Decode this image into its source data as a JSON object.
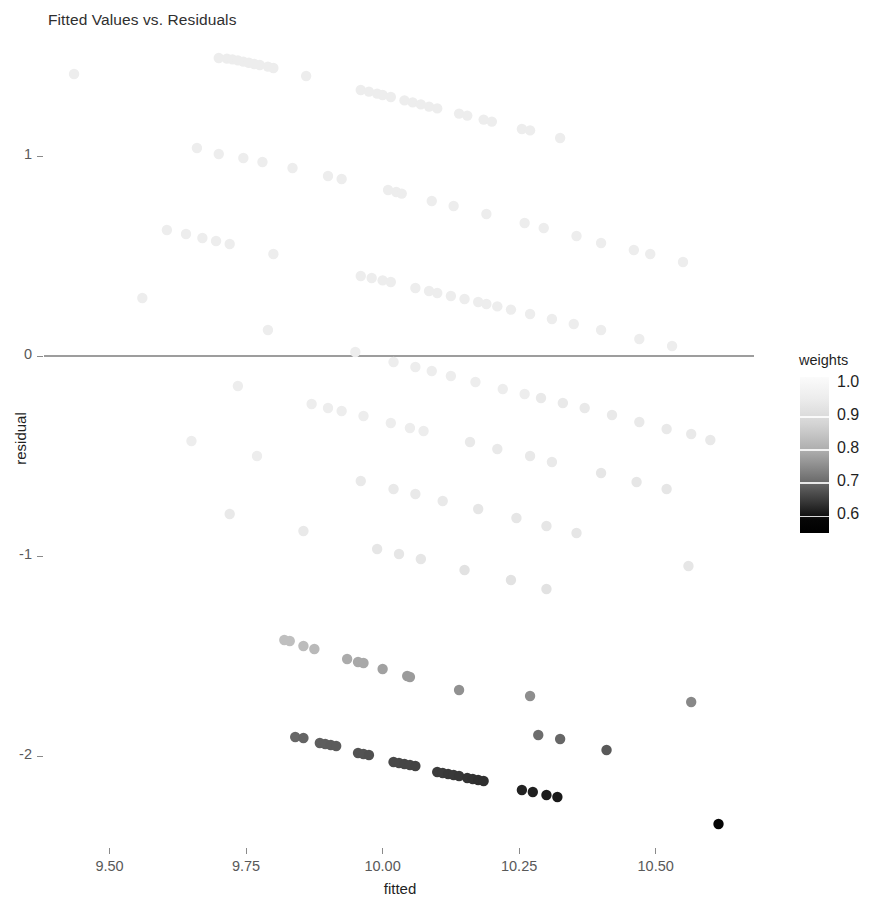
{
  "title": "Fitted Values vs. Residuals",
  "axes": {
    "x_title": "fitted",
    "y_title": "residual",
    "x_ticks": [
      "9.50",
      "9.75",
      "10.00",
      "10.25",
      "10.50"
    ],
    "y_ticks": [
      "1",
      "0",
      "-1",
      "-2"
    ]
  },
  "legend": {
    "title": "weights",
    "labels": [
      "1.0",
      "0.9",
      "0.8",
      "0.7",
      "0.6"
    ]
  },
  "chart_data": {
    "type": "scatter",
    "title": "Fitted Values vs. Residuals",
    "xlabel": "fitted",
    "ylabel": "residual",
    "xlim": [
      9.38,
      10.68
    ],
    "ylim": [
      -2.45,
      1.55
    ],
    "xticks": [
      9.5,
      9.75,
      10.0,
      10.25,
      10.5
    ],
    "yticks": [
      1,
      0,
      -1,
      -2
    ],
    "grid": false,
    "legend": {
      "title": "weights",
      "type": "continuous-colorbar",
      "position": "right",
      "ticks": [
        1.0,
        0.9,
        0.8,
        0.7,
        0.6
      ],
      "range": [
        0.55,
        1.02
      ],
      "low_color": "#000000",
      "high_color": "#ffffff"
    },
    "annotations": [
      {
        "type": "hline",
        "y": 0,
        "color": "#3d3d3d"
      }
    ],
    "color_key": "weights",
    "points": [
      {
        "x": 9.435,
        "y": 1.41,
        "w": 0.995
      },
      {
        "x": 9.7,
        "y": 1.49,
        "w": 0.995
      },
      {
        "x": 9.715,
        "y": 1.487,
        "w": 0.995
      },
      {
        "x": 9.725,
        "y": 1.483,
        "w": 0.995
      },
      {
        "x": 9.735,
        "y": 1.478,
        "w": 0.995
      },
      {
        "x": 9.745,
        "y": 1.472,
        "w": 0.995
      },
      {
        "x": 9.755,
        "y": 1.466,
        "w": 0.995
      },
      {
        "x": 9.765,
        "y": 1.46,
        "w": 0.995
      },
      {
        "x": 9.775,
        "y": 1.455,
        "w": 0.995
      },
      {
        "x": 9.79,
        "y": 1.447,
        "w": 0.995
      },
      {
        "x": 9.8,
        "y": 1.44,
        "w": 0.995
      },
      {
        "x": 9.86,
        "y": 1.4,
        "w": 0.995
      },
      {
        "x": 9.96,
        "y": 1.33,
        "w": 0.995
      },
      {
        "x": 9.975,
        "y": 1.322,
        "w": 0.995
      },
      {
        "x": 9.99,
        "y": 1.312,
        "w": 0.995
      },
      {
        "x": 10.0,
        "y": 1.305,
        "w": 0.995
      },
      {
        "x": 10.015,
        "y": 1.295,
        "w": 0.995
      },
      {
        "x": 10.04,
        "y": 1.278,
        "w": 0.995
      },
      {
        "x": 10.055,
        "y": 1.268,
        "w": 0.995
      },
      {
        "x": 10.07,
        "y": 1.258,
        "w": 0.995
      },
      {
        "x": 10.085,
        "y": 1.247,
        "w": 0.995
      },
      {
        "x": 10.1,
        "y": 1.238,
        "w": 0.995
      },
      {
        "x": 10.14,
        "y": 1.212,
        "w": 0.995
      },
      {
        "x": 10.155,
        "y": 1.202,
        "w": 0.995
      },
      {
        "x": 10.185,
        "y": 1.182,
        "w": 0.995
      },
      {
        "x": 10.2,
        "y": 1.172,
        "w": 0.995
      },
      {
        "x": 10.255,
        "y": 1.135,
        "w": 0.995
      },
      {
        "x": 10.27,
        "y": 1.128,
        "w": 0.995
      },
      {
        "x": 10.325,
        "y": 1.09,
        "w": 0.995
      },
      {
        "x": 9.66,
        "y": 1.04,
        "w": 0.995
      },
      {
        "x": 9.7,
        "y": 1.01,
        "w": 0.995
      },
      {
        "x": 9.745,
        "y": 0.99,
        "w": 0.995
      },
      {
        "x": 9.78,
        "y": 0.97,
        "w": 0.995
      },
      {
        "x": 9.835,
        "y": 0.94,
        "w": 0.995
      },
      {
        "x": 9.9,
        "y": 0.9,
        "w": 0.995
      },
      {
        "x": 9.925,
        "y": 0.885,
        "w": 0.995
      },
      {
        "x": 10.01,
        "y": 0.83,
        "w": 0.995
      },
      {
        "x": 10.025,
        "y": 0.82,
        "w": 0.995
      },
      {
        "x": 10.035,
        "y": 0.812,
        "w": 0.995
      },
      {
        "x": 10.09,
        "y": 0.775,
        "w": 0.995
      },
      {
        "x": 10.13,
        "y": 0.75,
        "w": 0.995
      },
      {
        "x": 10.19,
        "y": 0.71,
        "w": 0.995
      },
      {
        "x": 10.26,
        "y": 0.665,
        "w": 0.995
      },
      {
        "x": 10.295,
        "y": 0.64,
        "w": 0.995
      },
      {
        "x": 10.355,
        "y": 0.6,
        "w": 0.995
      },
      {
        "x": 10.4,
        "y": 0.565,
        "w": 0.995
      },
      {
        "x": 10.46,
        "y": 0.53,
        "w": 0.995
      },
      {
        "x": 10.49,
        "y": 0.51,
        "w": 0.995
      },
      {
        "x": 10.55,
        "y": 0.47,
        "w": 0.995
      },
      {
        "x": 9.605,
        "y": 0.63,
        "w": 0.995
      },
      {
        "x": 9.64,
        "y": 0.61,
        "w": 0.995
      },
      {
        "x": 9.67,
        "y": 0.59,
        "w": 0.995
      },
      {
        "x": 9.695,
        "y": 0.575,
        "w": 0.995
      },
      {
        "x": 9.72,
        "y": 0.56,
        "w": 0.995
      },
      {
        "x": 9.8,
        "y": 0.51,
        "w": 0.995
      },
      {
        "x": 9.96,
        "y": 0.4,
        "w": 0.995
      },
      {
        "x": 9.98,
        "y": 0.39,
        "w": 0.995
      },
      {
        "x": 10.0,
        "y": 0.378,
        "w": 0.995
      },
      {
        "x": 10.015,
        "y": 0.37,
        "w": 0.995
      },
      {
        "x": 10.06,
        "y": 0.34,
        "w": 0.995
      },
      {
        "x": 10.085,
        "y": 0.325,
        "w": 0.995
      },
      {
        "x": 10.1,
        "y": 0.315,
        "w": 0.995
      },
      {
        "x": 10.125,
        "y": 0.3,
        "w": 0.995
      },
      {
        "x": 10.15,
        "y": 0.285,
        "w": 0.995
      },
      {
        "x": 10.175,
        "y": 0.27,
        "w": 0.995
      },
      {
        "x": 10.19,
        "y": 0.26,
        "w": 0.995
      },
      {
        "x": 10.21,
        "y": 0.248,
        "w": 0.995
      },
      {
        "x": 10.235,
        "y": 0.232,
        "w": 0.995
      },
      {
        "x": 10.27,
        "y": 0.21,
        "w": 0.995
      },
      {
        "x": 10.31,
        "y": 0.185,
        "w": 0.995
      },
      {
        "x": 10.35,
        "y": 0.16,
        "w": 0.995
      },
      {
        "x": 10.4,
        "y": 0.13,
        "w": 0.995
      },
      {
        "x": 10.47,
        "y": 0.085,
        "w": 0.995
      },
      {
        "x": 10.53,
        "y": 0.05,
        "w": 0.995
      },
      {
        "x": 9.56,
        "y": 0.29,
        "w": 0.995
      },
      {
        "x": 9.79,
        "y": 0.13,
        "w": 0.995
      },
      {
        "x": 9.95,
        "y": 0.02,
        "w": 0.995
      },
      {
        "x": 10.02,
        "y": -0.03,
        "w": 0.995
      },
      {
        "x": 10.06,
        "y": -0.055,
        "w": 0.995
      },
      {
        "x": 10.09,
        "y": -0.075,
        "w": 0.995
      },
      {
        "x": 10.125,
        "y": -0.1,
        "w": 0.995
      },
      {
        "x": 10.17,
        "y": -0.13,
        "w": 0.995
      },
      {
        "x": 10.22,
        "y": -0.165,
        "w": 0.995
      },
      {
        "x": 10.26,
        "y": -0.19,
        "w": 0.995
      },
      {
        "x": 10.29,
        "y": -0.21,
        "w": 0.99
      },
      {
        "x": 10.33,
        "y": -0.235,
        "w": 0.99
      },
      {
        "x": 10.37,
        "y": -0.26,
        "w": 0.99
      },
      {
        "x": 10.42,
        "y": -0.295,
        "w": 0.99
      },
      {
        "x": 10.47,
        "y": -0.33,
        "w": 0.99
      },
      {
        "x": 10.52,
        "y": -0.365,
        "w": 0.99
      },
      {
        "x": 10.565,
        "y": -0.39,
        "w": 0.99
      },
      {
        "x": 10.6,
        "y": -0.42,
        "w": 0.99
      },
      {
        "x": 9.735,
        "y": -0.15,
        "w": 0.995
      },
      {
        "x": 9.87,
        "y": -0.24,
        "w": 0.995
      },
      {
        "x": 9.9,
        "y": -0.26,
        "w": 0.995
      },
      {
        "x": 9.925,
        "y": -0.275,
        "w": 0.995
      },
      {
        "x": 9.965,
        "y": -0.3,
        "w": 0.995
      },
      {
        "x": 10.015,
        "y": -0.335,
        "w": 0.995
      },
      {
        "x": 10.05,
        "y": -0.36,
        "w": 0.995
      },
      {
        "x": 10.075,
        "y": -0.375,
        "w": 0.995
      },
      {
        "x": 10.16,
        "y": -0.43,
        "w": 0.99
      },
      {
        "x": 10.21,
        "y": -0.465,
        "w": 0.99
      },
      {
        "x": 10.27,
        "y": -0.5,
        "w": 0.99
      },
      {
        "x": 10.31,
        "y": -0.53,
        "w": 0.99
      },
      {
        "x": 10.4,
        "y": -0.585,
        "w": 0.985
      },
      {
        "x": 10.465,
        "y": -0.63,
        "w": 0.985
      },
      {
        "x": 10.52,
        "y": -0.665,
        "w": 0.985
      },
      {
        "x": 9.65,
        "y": -0.425,
        "w": 0.995
      },
      {
        "x": 9.77,
        "y": -0.5,
        "w": 0.995
      },
      {
        "x": 9.96,
        "y": -0.625,
        "w": 0.99
      },
      {
        "x": 10.02,
        "y": -0.665,
        "w": 0.99
      },
      {
        "x": 10.06,
        "y": -0.69,
        "w": 0.99
      },
      {
        "x": 10.11,
        "y": -0.725,
        "w": 0.99
      },
      {
        "x": 10.175,
        "y": -0.765,
        "w": 0.985
      },
      {
        "x": 10.245,
        "y": -0.81,
        "w": 0.985
      },
      {
        "x": 10.3,
        "y": -0.85,
        "w": 0.985
      },
      {
        "x": 10.355,
        "y": -0.885,
        "w": 0.985
      },
      {
        "x": 9.72,
        "y": -0.79,
        "w": 0.99
      },
      {
        "x": 9.855,
        "y": -0.875,
        "w": 0.99
      },
      {
        "x": 9.99,
        "y": -0.965,
        "w": 0.985
      },
      {
        "x": 10.03,
        "y": -0.99,
        "w": 0.985
      },
      {
        "x": 10.07,
        "y": -1.015,
        "w": 0.985
      },
      {
        "x": 10.15,
        "y": -1.07,
        "w": 0.98
      },
      {
        "x": 10.235,
        "y": -1.12,
        "w": 0.98
      },
      {
        "x": 10.3,
        "y": -1.165,
        "w": 0.98
      },
      {
        "x": 10.56,
        "y": -1.05,
        "w": 0.985
      },
      {
        "x": 9.82,
        "y": -1.42,
        "w": 0.93
      },
      {
        "x": 9.83,
        "y": -1.425,
        "w": 0.93
      },
      {
        "x": 9.855,
        "y": -1.45,
        "w": 0.925
      },
      {
        "x": 9.875,
        "y": -1.465,
        "w": 0.92
      },
      {
        "x": 9.935,
        "y": -1.515,
        "w": 0.9
      },
      {
        "x": 9.955,
        "y": -1.53,
        "w": 0.895
      },
      {
        "x": 9.965,
        "y": -1.535,
        "w": 0.895
      },
      {
        "x": 10.0,
        "y": -1.565,
        "w": 0.885
      },
      {
        "x": 10.045,
        "y": -1.6,
        "w": 0.875
      },
      {
        "x": 10.05,
        "y": -1.605,
        "w": 0.875
      },
      {
        "x": 10.14,
        "y": -1.67,
        "w": 0.86
      },
      {
        "x": 10.27,
        "y": -1.7,
        "w": 0.855
      },
      {
        "x": 10.565,
        "y": -1.73,
        "w": 0.845
      },
      {
        "x": 9.84,
        "y": -1.905,
        "w": 0.79
      },
      {
        "x": 9.855,
        "y": -1.91,
        "w": 0.785
      },
      {
        "x": 9.885,
        "y": -1.935,
        "w": 0.775
      },
      {
        "x": 9.895,
        "y": -1.94,
        "w": 0.775
      },
      {
        "x": 9.905,
        "y": -1.945,
        "w": 0.77
      },
      {
        "x": 9.915,
        "y": -1.95,
        "w": 0.77
      },
      {
        "x": 9.955,
        "y": -1.985,
        "w": 0.755
      },
      {
        "x": 9.965,
        "y": -1.99,
        "w": 0.755
      },
      {
        "x": 9.975,
        "y": -1.995,
        "w": 0.75
      },
      {
        "x": 10.02,
        "y": -2.03,
        "w": 0.735
      },
      {
        "x": 10.03,
        "y": -2.035,
        "w": 0.735
      },
      {
        "x": 10.04,
        "y": -2.04,
        "w": 0.73
      },
      {
        "x": 10.05,
        "y": -2.045,
        "w": 0.73
      },
      {
        "x": 10.06,
        "y": -2.05,
        "w": 0.725
      },
      {
        "x": 10.1,
        "y": -2.08,
        "w": 0.71
      },
      {
        "x": 10.11,
        "y": -2.085,
        "w": 0.71
      },
      {
        "x": 10.12,
        "y": -2.09,
        "w": 0.705
      },
      {
        "x": 10.13,
        "y": -2.095,
        "w": 0.705
      },
      {
        "x": 10.14,
        "y": -2.1,
        "w": 0.7
      },
      {
        "x": 10.155,
        "y": -2.11,
        "w": 0.695
      },
      {
        "x": 10.165,
        "y": -2.115,
        "w": 0.69
      },
      {
        "x": 10.175,
        "y": -2.12,
        "w": 0.685
      },
      {
        "x": 10.185,
        "y": -2.125,
        "w": 0.685
      },
      {
        "x": 10.255,
        "y": -2.17,
        "w": 0.655
      },
      {
        "x": 10.275,
        "y": -2.18,
        "w": 0.65
      },
      {
        "x": 10.3,
        "y": -2.195,
        "w": 0.64
      },
      {
        "x": 10.32,
        "y": -2.205,
        "w": 0.635
      },
      {
        "x": 10.285,
        "y": -1.895,
        "w": 0.8
      },
      {
        "x": 10.325,
        "y": -1.915,
        "w": 0.79
      },
      {
        "x": 10.41,
        "y": -1.97,
        "w": 0.765
      },
      {
        "x": 10.615,
        "y": -2.34,
        "w": 0.575
      }
    ]
  }
}
